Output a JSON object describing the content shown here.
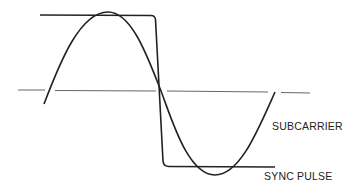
{
  "diagram": {
    "type": "waveform",
    "colors": {
      "background": "#ffffff",
      "stroke": "#222222",
      "axis": "#555555"
    },
    "labels": {
      "subcarrier": "SUBCARRIER",
      "sync_pulse": "SYNC PULSE"
    },
    "elements": [
      {
        "id": "sync-pulse",
        "kind": "step-waveform",
        "label": "SYNC PULSE"
      },
      {
        "id": "subcarrier",
        "kind": "sine-wave",
        "label": "SUBCARRIER"
      },
      {
        "id": "reference-axis",
        "kind": "dashed-line"
      }
    ]
  }
}
